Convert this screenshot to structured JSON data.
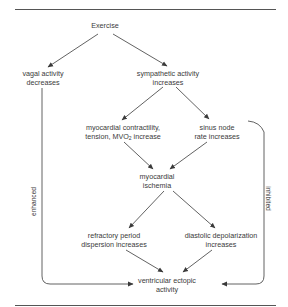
{
  "diagram": {
    "type": "flowchart",
    "nodes": {
      "exercise": {
        "line1": "Exercise"
      },
      "vagal": {
        "line1": "vagal activity",
        "line2": "decreases"
      },
      "sympathetic": {
        "line1": "sympathetic activity",
        "line2": "increases"
      },
      "contractility": {
        "line1": "myocardial contractility,",
        "line2a": "tension, MVO",
        "line2sub": "2",
        "line2b": " increase"
      },
      "sinus": {
        "line1": "sinus node",
        "line2": "rate increases"
      },
      "ischemia": {
        "line1": "myocardial",
        "line2": "ischemia"
      },
      "refractory": {
        "line1": "refractory period",
        "line2": "dispersion increases"
      },
      "diastolic": {
        "line1": "diastolic depolarization",
        "line2": "increases"
      },
      "ventricular": {
        "line1": "ventricular ectopic",
        "line2": "activity"
      }
    },
    "edge_labels": {
      "enhanced": "enhanced",
      "inhibited": "inhibited"
    },
    "edges": [
      {
        "from": "exercise",
        "to": "vagal"
      },
      {
        "from": "exercise",
        "to": "sympathetic"
      },
      {
        "from": "sympathetic",
        "to": "contractility"
      },
      {
        "from": "sympathetic",
        "to": "sinus"
      },
      {
        "from": "contractility",
        "to": "ischemia"
      },
      {
        "from": "sinus",
        "to": "ischemia"
      },
      {
        "from": "ischemia",
        "to": "refractory"
      },
      {
        "from": "ischemia",
        "to": "diastolic"
      },
      {
        "from": "refractory",
        "to": "ventricular"
      },
      {
        "from": "diastolic",
        "to": "ventricular"
      },
      {
        "from": "vagal",
        "to": "ventricular",
        "label": "enhanced"
      },
      {
        "from": "sinus",
        "to": "ventricular",
        "label": "inhibited"
      }
    ],
    "colors": {
      "line": "#3a3a3a",
      "text": "#3a3a3a",
      "background": "#ffffff"
    }
  }
}
